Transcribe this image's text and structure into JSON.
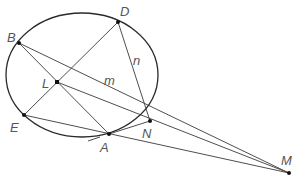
{
  "diagram": {
    "type": "geometry",
    "circle": {
      "cx": 82,
      "cy": 75,
      "rx": 76,
      "ry": 62
    },
    "points": {
      "B": {
        "label": "B",
        "x": 19,
        "y": 43
      },
      "D": {
        "label": "D",
        "x": 118,
        "y": 22
      },
      "L": {
        "label": "L",
        "x": 57,
        "y": 82
      },
      "E": {
        "label": "E",
        "x": 24,
        "y": 115
      },
      "A": {
        "label": "A",
        "x": 109,
        "y": 134
      },
      "N": {
        "label": "N",
        "x": 150,
        "y": 121
      },
      "M": {
        "label": "M",
        "x": 289,
        "y": 173
      }
    },
    "line_labels": {
      "m": "m",
      "n": "n"
    },
    "segments": [
      [
        "B",
        "M"
      ],
      [
        "B",
        "A"
      ],
      [
        "D",
        "E"
      ],
      [
        "L",
        "M"
      ],
      [
        "E",
        "M"
      ],
      [
        "A",
        "N"
      ],
      [
        "D",
        "N"
      ]
    ]
  }
}
